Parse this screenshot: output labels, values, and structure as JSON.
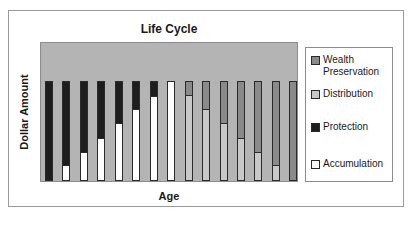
{
  "chart_data": {
    "type": "bar",
    "stacked": true,
    "title": "Life Cycle",
    "xlabel": "Age",
    "ylabel": "Dollar Amount",
    "categories": [
      "1",
      "2",
      "3",
      "4",
      "5",
      "6",
      "7",
      "8",
      "9",
      "10",
      "11",
      "12",
      "13",
      "14",
      "15"
    ],
    "series": [
      {
        "name": "Accumulation",
        "color": "#ffffff",
        "values": [
          0,
          14,
          28,
          42,
          57,
          71,
          85,
          100,
          0,
          0,
          0,
          0,
          0,
          0,
          0
        ]
      },
      {
        "name": "Protection",
        "color": "#1e1e1e",
        "values": [
          100,
          86,
          72,
          58,
          43,
          29,
          15,
          0,
          0,
          0,
          0,
          0,
          0,
          0,
          0
        ]
      },
      {
        "name": "Distribution",
        "color": "#c8c8c8",
        "values": [
          0,
          0,
          0,
          0,
          0,
          0,
          0,
          0,
          86,
          71,
          57,
          42,
          28,
          14,
          0
        ]
      },
      {
        "name": "Wealth Preservation",
        "color": "#8a8a8a",
        "values": [
          0,
          0,
          0,
          0,
          0,
          0,
          0,
          0,
          14,
          29,
          43,
          58,
          72,
          86,
          100
        ]
      }
    ],
    "ylim": [
      0,
      100
    ],
    "grid": false,
    "legend_position": "right",
    "tick_labels_shown": false
  },
  "legend": {
    "items": [
      {
        "label_line1": "Wealth",
        "label_line2": "Preservation",
        "color": "#8a8a8a"
      },
      {
        "label_line1": "Distribution",
        "label_line2": "",
        "color": "#c8c8c8"
      },
      {
        "label_line1": "Protection",
        "label_line2": "",
        "color": "#1e1e1e"
      },
      {
        "label_line1": "Accumulation",
        "label_line2": "",
        "color": "#ffffff"
      }
    ]
  },
  "colors": {
    "plot_background": "#b4b4b4",
    "frame_border": "#9a9a9a"
  }
}
